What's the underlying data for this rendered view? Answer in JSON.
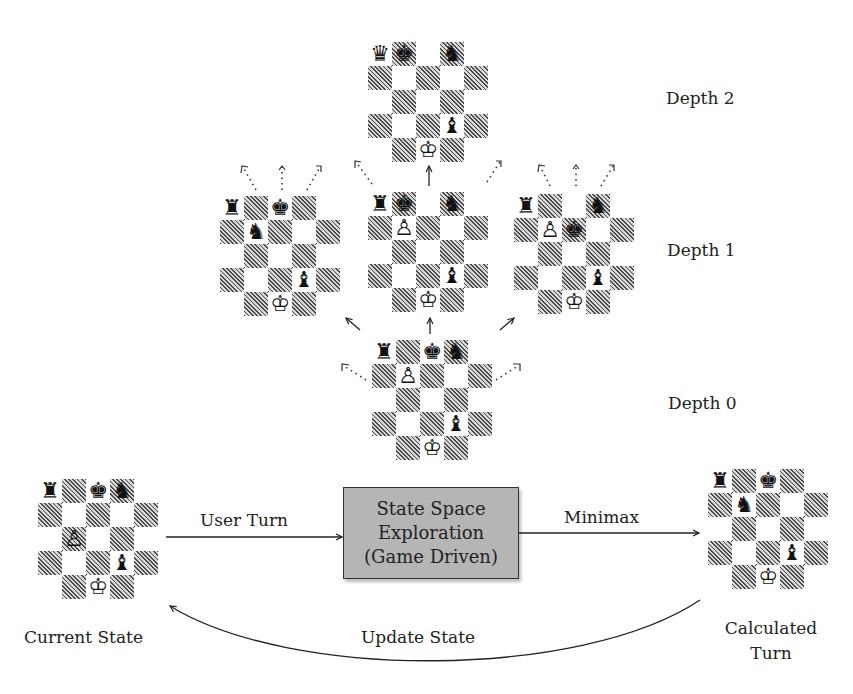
{
  "diagram": {
    "depth_labels": [
      "Depth 2",
      "Depth 1",
      "Depth 0"
    ],
    "process_box": {
      "lines": [
        "State Space",
        "Exploration",
        "(Game Driven)"
      ],
      "fill": "#b5b5b5"
    },
    "edges": {
      "user_turn": "User Turn",
      "minimax": "Minimax",
      "update_state": "Update State"
    },
    "node_labels": {
      "current_state": "Current State",
      "calculated_turn_line1": "Calculated",
      "calculated_turn_line2": "Turn"
    },
    "boards": {
      "depth2": {
        "pieces": [
          {
            "r": 0,
            "c": 0,
            "glyph": "♛",
            "name": "black-queen"
          },
          {
            "r": 0,
            "c": 1,
            "glyph": "♚",
            "name": "black-king"
          },
          {
            "r": 0,
            "c": 3,
            "glyph": "♞",
            "name": "black-knight"
          },
          {
            "r": 3,
            "c": 3,
            "glyph": "♝",
            "name": "black-bishop"
          },
          {
            "r": 4,
            "c": 2,
            "glyph": "♔",
            "name": "white-king"
          }
        ]
      },
      "depth1_left": {
        "pieces": [
          {
            "r": 0,
            "c": 0,
            "glyph": "♜",
            "name": "black-rook"
          },
          {
            "r": 0,
            "c": 2,
            "glyph": "♚",
            "name": "black-king"
          },
          {
            "r": 1,
            "c": 1,
            "glyph": "♞",
            "name": "black-knight"
          },
          {
            "r": 3,
            "c": 3,
            "glyph": "♝",
            "name": "black-bishop"
          },
          {
            "r": 4,
            "c": 2,
            "glyph": "♔",
            "name": "white-king"
          }
        ]
      },
      "depth1_center": {
        "pieces": [
          {
            "r": 0,
            "c": 0,
            "glyph": "♜",
            "name": "black-rook"
          },
          {
            "r": 0,
            "c": 1,
            "glyph": "♚",
            "name": "black-king"
          },
          {
            "r": 0,
            "c": 3,
            "glyph": "♞",
            "name": "black-knight"
          },
          {
            "r": 1,
            "c": 1,
            "glyph": "♙",
            "name": "white-pawn"
          },
          {
            "r": 3,
            "c": 3,
            "glyph": "♝",
            "name": "black-bishop"
          },
          {
            "r": 4,
            "c": 2,
            "glyph": "♔",
            "name": "white-king"
          }
        ]
      },
      "depth1_right": {
        "pieces": [
          {
            "r": 0,
            "c": 0,
            "glyph": "♜",
            "name": "black-rook"
          },
          {
            "r": 0,
            "c": 3,
            "glyph": "♞",
            "name": "black-knight"
          },
          {
            "r": 1,
            "c": 1,
            "glyph": "♙",
            "name": "white-pawn"
          },
          {
            "r": 1,
            "c": 2,
            "glyph": "♚",
            "name": "black-king"
          },
          {
            "r": 3,
            "c": 3,
            "glyph": "♝",
            "name": "black-bishop"
          },
          {
            "r": 4,
            "c": 2,
            "glyph": "♔",
            "name": "white-king"
          }
        ]
      },
      "depth0": {
        "pieces": [
          {
            "r": 0,
            "c": 0,
            "glyph": "♜",
            "name": "black-rook"
          },
          {
            "r": 0,
            "c": 2,
            "glyph": "♚",
            "name": "black-king"
          },
          {
            "r": 0,
            "c": 3,
            "glyph": "♞",
            "name": "black-knight"
          },
          {
            "r": 1,
            "c": 1,
            "glyph": "♙",
            "name": "white-pawn"
          },
          {
            "r": 3,
            "c": 3,
            "glyph": "♝",
            "name": "black-bishop"
          },
          {
            "r": 4,
            "c": 2,
            "glyph": "♔",
            "name": "white-king"
          }
        ]
      },
      "current_state": {
        "pieces": [
          {
            "r": 0,
            "c": 0,
            "glyph": "♜",
            "name": "black-rook"
          },
          {
            "r": 0,
            "c": 2,
            "glyph": "♚",
            "name": "black-king"
          },
          {
            "r": 0,
            "c": 3,
            "glyph": "♞",
            "name": "black-knight"
          },
          {
            "r": 2,
            "c": 1,
            "glyph": "♙",
            "name": "white-pawn"
          },
          {
            "r": 3,
            "c": 3,
            "glyph": "♝",
            "name": "black-bishop"
          },
          {
            "r": 4,
            "c": 2,
            "glyph": "♔",
            "name": "white-king"
          }
        ]
      },
      "calculated_turn": {
        "pieces": [
          {
            "r": 0,
            "c": 0,
            "glyph": "♜",
            "name": "black-rook"
          },
          {
            "r": 0,
            "c": 2,
            "glyph": "♚",
            "name": "black-king"
          },
          {
            "r": 1,
            "c": 1,
            "glyph": "♞",
            "name": "black-knight"
          },
          {
            "r": 3,
            "c": 3,
            "glyph": "♝",
            "name": "black-bishop"
          },
          {
            "r": 4,
            "c": 2,
            "glyph": "♔",
            "name": "white-king"
          }
        ]
      }
    }
  }
}
